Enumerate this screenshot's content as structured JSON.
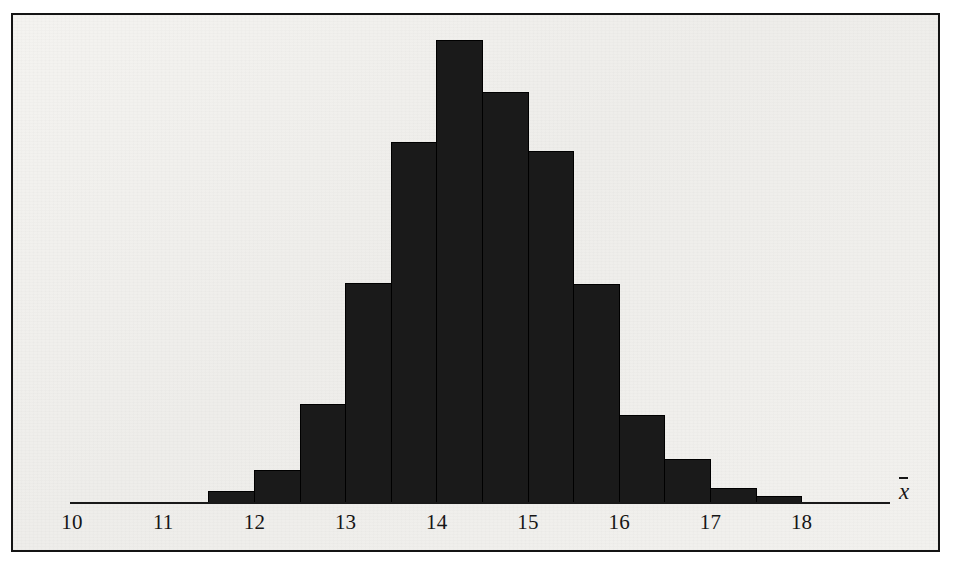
{
  "figure": {
    "kind": "histogram",
    "axis_title": "x̄",
    "axis_title_glyph": "x",
    "background_color": "#f0efec",
    "bar_color": "#1a1a1a",
    "axis_color": "#191919",
    "frame_color": "#141414"
  },
  "axis": {
    "tick_labels": [
      "10",
      "11",
      "12",
      "13",
      "14",
      "15",
      "16",
      "17",
      "18"
    ],
    "tick_values": [
      10,
      11,
      12,
      13,
      14,
      15,
      16,
      17,
      18
    ]
  },
  "chart_data": {
    "type": "bar",
    "title": "",
    "subtitle": "",
    "xlabel": "x̄",
    "ylabel": "",
    "grid": false,
    "legend": false,
    "legend_position": "none",
    "xlim": [
      10,
      18.5
    ],
    "ylim": [
      0,
      1.0
    ],
    "bin_width": 0.5,
    "bin_edges": [
      11.5,
      12.0,
      12.5,
      13.0,
      13.5,
      14.0,
      14.5,
      15.0,
      15.5,
      16.0,
      16.5,
      17.0,
      17.5,
      18.0
    ],
    "categories": [
      "11.5-12.0",
      "12.0-12.5",
      "12.5-13.0",
      "13.0-13.5",
      "13.5-14.0",
      "14.0-14.5",
      "14.5-15.0",
      "15.0-15.5",
      "15.5-16.0",
      "16.0-16.5",
      "16.5-17.0",
      "17.0-17.5",
      "17.5-18.0"
    ],
    "x": [
      11.75,
      12.25,
      12.75,
      13.25,
      13.75,
      14.25,
      14.75,
      15.25,
      15.75,
      16.25,
      16.75,
      17.25,
      17.75
    ],
    "values": [
      0.024,
      0.071,
      0.212,
      0.475,
      0.778,
      1.0,
      0.886,
      0.76,
      0.471,
      0.188,
      0.093,
      0.032,
      0.013
    ],
    "bars": [
      {
        "bin_start": 11.5,
        "bin_end": 12.0,
        "value": 0.024
      },
      {
        "bin_start": 12.0,
        "bin_end": 12.5,
        "value": 0.071
      },
      {
        "bin_start": 12.5,
        "bin_end": 13.0,
        "value": 0.212
      },
      {
        "bin_start": 13.0,
        "bin_end": 13.5,
        "value": 0.475
      },
      {
        "bin_start": 13.5,
        "bin_end": 14.0,
        "value": 0.778
      },
      {
        "bin_start": 14.0,
        "bin_end": 14.5,
        "value": 1.0
      },
      {
        "bin_start": 14.5,
        "bin_end": 15.0,
        "value": 0.886
      },
      {
        "bin_start": 15.0,
        "bin_end": 15.5,
        "value": 0.76
      },
      {
        "bin_start": 15.5,
        "bin_end": 16.0,
        "value": 0.471
      },
      {
        "bin_start": 16.0,
        "bin_end": 16.5,
        "value": 0.188
      },
      {
        "bin_start": 16.5,
        "bin_end": 17.0,
        "value": 0.093
      },
      {
        "bin_start": 17.0,
        "bin_end": 17.5,
        "value": 0.032
      },
      {
        "bin_start": 17.5,
        "bin_end": 18.0,
        "value": 0.013
      }
    ],
    "annotations": []
  },
  "geometry": {
    "x_origin_px": 72,
    "px_per_unit": 91.2,
    "baseline_y_px": 503,
    "max_bar_height_px": 463,
    "axis_start_x_px": 70,
    "axis_end_x_px": 890,
    "tick_label_y_px": 529
  }
}
